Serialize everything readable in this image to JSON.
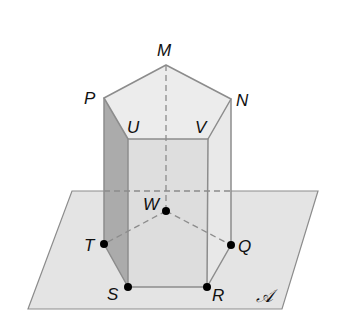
{
  "figure": {
    "type": "pentagonal-prism-on-plane",
    "plane_label": "𝒜",
    "top_vertices": [
      {
        "name": "M",
        "x": 166,
        "y": 65
      },
      {
        "name": "N",
        "x": 231,
        "y": 99
      },
      {
        "name": "V",
        "x": 208,
        "y": 139
      },
      {
        "name": "U",
        "x": 128,
        "y": 139
      },
      {
        "name": "P",
        "x": 104,
        "y": 98
      }
    ],
    "bottom_vertices": [
      {
        "name": "W",
        "x": 166,
        "y": 211,
        "dot": true
      },
      {
        "name": "Q",
        "x": 231,
        "y": 245,
        "dot": true
      },
      {
        "name": "R",
        "x": 207,
        "y": 287,
        "dot": true
      },
      {
        "name": "S",
        "x": 128,
        "y": 287,
        "dot": true
      },
      {
        "name": "T",
        "x": 104,
        "y": 244,
        "dot": true
      }
    ],
    "labels": {
      "M": "M",
      "N": "N",
      "P": "P",
      "U": "U",
      "V": "V",
      "W": "W",
      "T": "T",
      "Q": "Q",
      "S": "S",
      "R": "R",
      "plane": "𝒜"
    },
    "colors": {
      "plane_fill": "#e4e4e4",
      "edge": "#8c8c8c",
      "top_face": "#ececec",
      "front_face": "#dedede",
      "left_face": "#ababab",
      "right_face": "#e6e6e6",
      "dot": "#000000"
    }
  }
}
